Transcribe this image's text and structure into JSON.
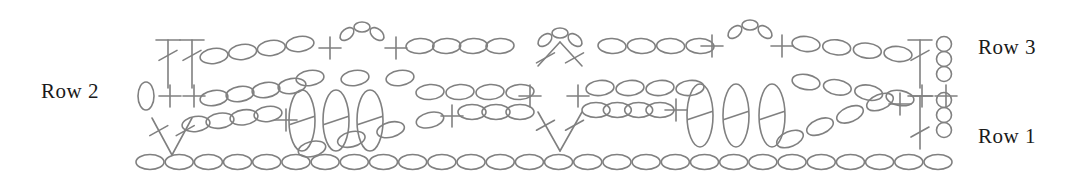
{
  "figure": {
    "kind": "crochet-stitch-diagram",
    "background_color": "#ffffff",
    "stroke_color": "#808080",
    "label_color": "#1a1a1a",
    "stroke_width": 1.6,
    "width": 1073,
    "height": 189
  },
  "labels": {
    "row1": "Row 1",
    "row2": "Row 2",
    "row3": "Row 3"
  },
  "legend_symbols": [
    {
      "name": "chain-stitch",
      "glyph": "ellipse",
      "meaning": "chain (ch)"
    },
    {
      "name": "single-crochet",
      "glyph": "plus",
      "meaning": "single crochet (sc)"
    },
    {
      "name": "double-crochet",
      "glyph": "t-with-crossbar",
      "meaning": "double crochet (dc)"
    },
    {
      "name": "cluster-stitch",
      "glyph": "v-converging",
      "meaning": "2-dc cluster / decrease"
    },
    {
      "name": "loop-stitch",
      "glyph": "tall-narrow-ellipse",
      "meaning": "raised loop stitch"
    },
    {
      "name": "slip-stitch",
      "glyph": "small-vertical-ellipse",
      "meaning": "slip stitch (sl st)"
    }
  ],
  "chart_data": {
    "type": "diagram",
    "title": "",
    "rows": [
      {
        "name": "Row 1",
        "y": 160,
        "description": "Foundation chain running the full width",
        "stitch_count": 28,
        "symbol": "chain-stitch"
      },
      {
        "name": "Row 2",
        "y": 96,
        "description": "Single crochets, chains, clusters and raised loop groups",
        "symbol": "mixed"
      },
      {
        "name": "Row 3",
        "y": 45,
        "description": "Double crochets, chain arcs and cluster peaks",
        "symbol": "mixed"
      }
    ],
    "foundation_chain": {
      "y": 162,
      "x_start": 150,
      "x_end": 938,
      "count": 28,
      "rx": 14,
      "ry": 7.5
    },
    "row1_stitches": [
      {
        "type": "cluster",
        "x": 172,
        "dir": "down"
      },
      {
        "type": "chain-arc",
        "x_start": 196,
        "x_end": 268,
        "count": 4,
        "slope": -1
      },
      {
        "type": "single-crochet",
        "x": 286
      },
      {
        "type": "loop-group",
        "x_start": 300,
        "count": 3,
        "dir": "down"
      },
      {
        "type": "chain-arc",
        "x_start": 372,
        "x_end": 430,
        "count": 3,
        "slope": 1
      },
      {
        "type": "single-crochet",
        "x": 452
      },
      {
        "type": "chain-run",
        "x_start": 470,
        "x_end": 510,
        "count": 2
      },
      {
        "type": "cluster",
        "x": 560,
        "dir": "down"
      },
      {
        "type": "chain-run",
        "x_start": 600,
        "x_end": 700,
        "count": 4
      },
      {
        "type": "single-crochet",
        "x": 672
      },
      {
        "type": "loop-group",
        "x_start": 690,
        "count": 3,
        "dir": "down"
      },
      {
        "type": "chain-arc",
        "x_start": 800,
        "x_end": 880,
        "count": 4,
        "slope": -1
      },
      {
        "type": "single-crochet",
        "x": 900
      },
      {
        "type": "double-crochet",
        "x": 920
      },
      {
        "type": "turning-chain",
        "x": 944,
        "count": 3
      }
    ],
    "row2_stitches": [
      {
        "type": "slip-stitch",
        "x": 146
      },
      {
        "type": "single-crochet",
        "x": 168
      },
      {
        "type": "single-crochet",
        "x": 192
      },
      {
        "type": "chain-arc",
        "x_start": 212,
        "x_end": 288,
        "count": 4,
        "slope": -1
      },
      {
        "type": "loop-group",
        "x_start": 300,
        "count": 3,
        "dir": "up"
      },
      {
        "type": "chain-run",
        "x_start": 440,
        "x_end": 520,
        "count": 4
      },
      {
        "type": "single-crochet",
        "x": 530
      },
      {
        "type": "single-crochet",
        "x": 578
      },
      {
        "type": "chain-run",
        "x_start": 600,
        "x_end": 690,
        "count": 4
      },
      {
        "type": "loop-group",
        "x_start": 690,
        "count": 3,
        "dir": "up"
      },
      {
        "type": "chain-arc",
        "x_start": 820,
        "x_end": 900,
        "count": 4,
        "slope": 1
      },
      {
        "type": "single-crochet",
        "x": 922
      },
      {
        "type": "single-crochet",
        "x": 944
      }
    ],
    "row3_stitches": [
      {
        "type": "double-crochet",
        "x": 168
      },
      {
        "type": "double-crochet",
        "x": 192
      },
      {
        "type": "chain-arc",
        "x_start": 212,
        "x_end": 300,
        "count": 4,
        "slope": 1
      },
      {
        "type": "single-crochet",
        "x": 330
      },
      {
        "type": "cluster-peak",
        "x": 362,
        "count": 3
      },
      {
        "type": "single-crochet",
        "x": 396
      },
      {
        "type": "chain-run",
        "x_start": 420,
        "x_end": 500,
        "count": 4
      },
      {
        "type": "cluster",
        "x": 560,
        "dir": "up"
      },
      {
        "type": "chain-run",
        "x_start": 610,
        "x_end": 700,
        "count": 4
      },
      {
        "type": "single-crochet",
        "x": 712
      },
      {
        "type": "cluster-peak",
        "x": 750,
        "count": 3
      },
      {
        "type": "single-crochet",
        "x": 782
      },
      {
        "type": "chain-arc",
        "x_start": 806,
        "x_end": 900,
        "count": 4,
        "slope": -1
      },
      {
        "type": "double-crochet",
        "x": 920
      },
      {
        "type": "turning-chain",
        "x": 944,
        "count": 3
      }
    ]
  }
}
